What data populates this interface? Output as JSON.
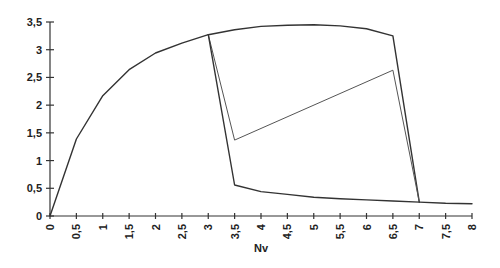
{
  "chart_data": {
    "type": "line",
    "title": "",
    "xlabel": "Nv",
    "ylabel": "",
    "xlim": [
      0,
      8
    ],
    "ylim": [
      0,
      3.5
    ],
    "grid": false,
    "legend": null,
    "x_ticks": [
      "0",
      "0,5",
      "1",
      "1,5",
      "2",
      "2,5",
      "3",
      "3,5",
      "4",
      "4,5",
      "5",
      "5,5",
      "6",
      "6,5",
      "7",
      "7,5",
      "8"
    ],
    "y_ticks": [
      "0",
      "0,5",
      "1",
      "1,5",
      "2",
      "2,5",
      "3",
      "3,5"
    ],
    "series": [
      {
        "name": "rising-curve",
        "stroke": "#333333",
        "width": 1.4,
        "points": [
          [
            0,
            0
          ],
          [
            0.5,
            1.39
          ],
          [
            1,
            2.17
          ],
          [
            1.5,
            2.64
          ],
          [
            2,
            2.94
          ],
          [
            2.5,
            3.12
          ],
          [
            3,
            3.27
          ]
        ]
      },
      {
        "name": "upper-plateau",
        "stroke": "#333333",
        "width": 1.4,
        "points": [
          [
            3,
            3.27
          ],
          [
            3.5,
            3.36
          ],
          [
            4,
            3.42
          ],
          [
            4.5,
            3.44
          ],
          [
            5,
            3.45
          ],
          [
            5.5,
            3.43
          ],
          [
            6,
            3.38
          ],
          [
            6.5,
            3.25
          ],
          [
            7,
            0.25
          ]
        ]
      },
      {
        "name": "inner-loop",
        "stroke": "#555555",
        "width": 1.0,
        "points": [
          [
            3,
            3.27
          ],
          [
            3.5,
            1.37
          ],
          [
            6.5,
            2.63
          ],
          [
            7,
            0.25
          ]
        ]
      },
      {
        "name": "lower-decay",
        "stroke": "#333333",
        "width": 1.4,
        "points": [
          [
            3,
            3.27
          ],
          [
            3.5,
            0.56
          ],
          [
            4,
            0.44
          ],
          [
            4.5,
            0.39
          ],
          [
            5,
            0.34
          ],
          [
            5.5,
            0.31
          ],
          [
            6,
            0.29
          ],
          [
            6.5,
            0.27
          ],
          [
            7,
            0.25
          ],
          [
            7.5,
            0.23
          ],
          [
            8,
            0.22
          ]
        ]
      }
    ]
  }
}
